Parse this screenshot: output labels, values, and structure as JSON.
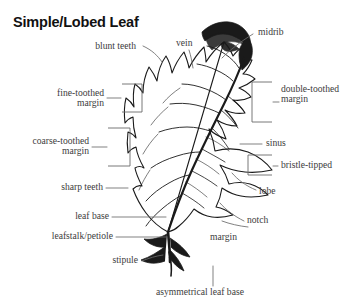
{
  "title": "Simple/Lobed Leaf",
  "diagram": {
    "background_color": "#ffffff",
    "ink_color": "#1a1a1a",
    "label_color": "#3c3c3c"
  },
  "labels": {
    "blunt_teeth": "blunt teeth",
    "vein": "vein",
    "midrib": "midrib",
    "fine_toothed_margin_l1": "fine-toothed",
    "fine_toothed_margin_l2": "margin",
    "double_toothed_margin_l1": "double-toothed",
    "double_toothed_margin_l2": "margin",
    "coarse_toothed_margin_l1": "coarse-toothed",
    "coarse_toothed_margin_l2": "margin",
    "sinus": "sinus",
    "bristle_tipped": "bristle-tipped",
    "lobe": "lobe",
    "sharp_teeth": "sharp teeth",
    "notch": "notch",
    "margin": "margin",
    "leaf_base": "leaf base",
    "leafstalk_petiole": "leafstalk/petiole",
    "stipule": "stipule",
    "asymmetrical_leaf_base": "asymmetrical leaf base"
  }
}
